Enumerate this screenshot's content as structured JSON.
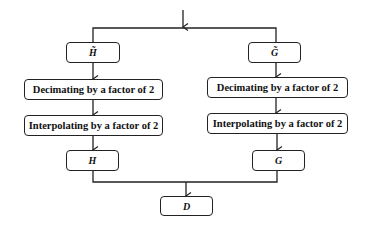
{
  "diagram": {
    "type": "flowchart",
    "colors": {
      "line": "#222222",
      "box_border": "#222222",
      "text": "#111111",
      "background": "#ffffff"
    },
    "nodes": {
      "h_tilde": {
        "label": "H̃"
      },
      "g_tilde": {
        "label": "G̃"
      },
      "decimate_left": {
        "label": "Decimating by a factor of 2"
      },
      "decimate_right": {
        "label": "Decimating by a factor of 2"
      },
      "interpolate_left": {
        "label": "Interpolating by a factor of 2"
      },
      "interpolate_right": {
        "label": "Interpolating by a factor of 2"
      },
      "h": {
        "label": "H"
      },
      "g": {
        "label": "G"
      },
      "d": {
        "label": "D"
      }
    },
    "edges": [
      {
        "from": "input",
        "to": "h_tilde"
      },
      {
        "from": "input",
        "to": "g_tilde"
      },
      {
        "from": "h_tilde",
        "to": "decimate_left"
      },
      {
        "from": "decimate_left",
        "to": "interpolate_left"
      },
      {
        "from": "interpolate_left",
        "to": "h"
      },
      {
        "from": "g_tilde",
        "to": "decimate_right"
      },
      {
        "from": "decimate_right",
        "to": "interpolate_right"
      },
      {
        "from": "interpolate_right",
        "to": "g"
      },
      {
        "from": "h",
        "to": "d"
      },
      {
        "from": "g",
        "to": "d"
      }
    ]
  }
}
